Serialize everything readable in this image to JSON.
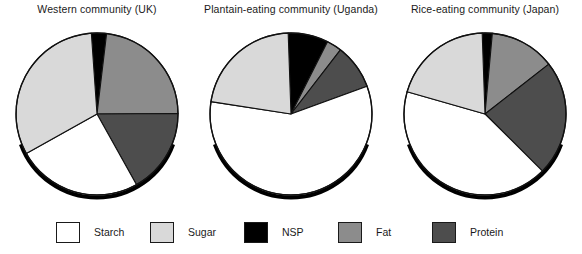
{
  "figure": {
    "kind": "pie-chart-panel-set",
    "panel_count": 3
  },
  "legend": {
    "items": [
      {
        "label": "Starch",
        "color": "#ffffff",
        "key": "starch"
      },
      {
        "label": "Sugar",
        "color": "#d9d9d9",
        "key": "sugar"
      },
      {
        "label": "NSP",
        "color": "#000000",
        "key": "nsp"
      },
      {
        "label": "Fat",
        "color": "#8c8c8c",
        "key": "fat"
      },
      {
        "label": "Protein",
        "color": "#4d4d4d",
        "key": "protein"
      }
    ]
  },
  "chart_data": [
    {
      "type": "pie",
      "title": "Western community (UK)",
      "categories": [
        "NSP",
        "Fat",
        "Protein",
        "Starch",
        "Sugar"
      ],
      "values": [
        3,
        23,
        17,
        25,
        32
      ],
      "colors": [
        "#000000",
        "#8c8c8c",
        "#4d4d4d",
        "#ffffff",
        "#d9d9d9"
      ],
      "start_angle_deg": -4,
      "units": "percent of dietary energy",
      "legend_position": "bottom"
    },
    {
      "type": "pie",
      "title": "Plantain-eating community (Uganda)",
      "categories": [
        "NSP",
        "Fat",
        "Protein",
        "Starch",
        "Sugar"
      ],
      "values": [
        8,
        3,
        9,
        58,
        22
      ],
      "colors": [
        "#000000",
        "#8c8c8c",
        "#4d4d4d",
        "#ffffff",
        "#d9d9d9"
      ],
      "start_angle_deg": -2,
      "units": "percent of dietary energy",
      "legend_position": "bottom"
    },
    {
      "type": "pie",
      "title": "Rice-eating community (Japan)",
      "categories": [
        "NSP",
        "Fat",
        "Protein",
        "Starch",
        "Sugar"
      ],
      "values": [
        2,
        13,
        23,
        42,
        20
      ],
      "colors": [
        "#000000",
        "#8c8c8c",
        "#4d4d4d",
        "#ffffff",
        "#d9d9d9"
      ],
      "start_angle_deg": -2,
      "units": "percent of dietary energy",
      "legend_position": "bottom"
    }
  ]
}
